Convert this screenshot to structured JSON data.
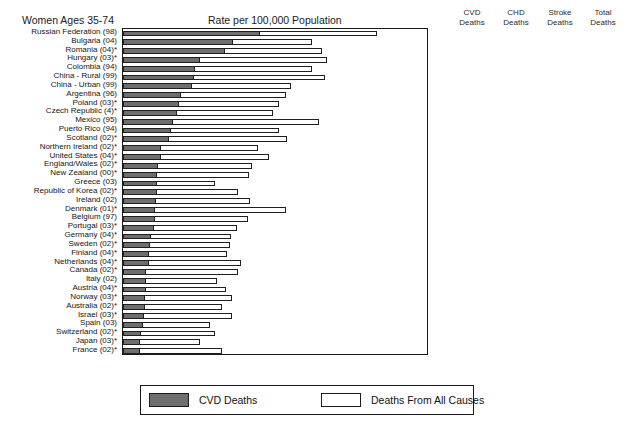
{
  "header": {
    "left_title": "Women Ages 35-74",
    "center_title": "Rate per 100,000 Population"
  },
  "columns": [
    {
      "line1": "CVD",
      "line2": "Deaths"
    },
    {
      "line1": "CHD",
      "line2": "Deaths"
    },
    {
      "line1": "Stroke",
      "line2": "Deaths"
    },
    {
      "line1": "Total",
      "line2": "Deaths"
    }
  ],
  "legend": {
    "cvd_label": "CVD Deaths",
    "all_label": "Deaths From All Causes",
    "cvd_color": "#6e6e6e",
    "all_color": "#ffffff"
  },
  "axis": {
    "ticks": [
      0,
      200,
      400,
      600,
      800,
      1000,
      1200
    ],
    "tick_labels": [
      "0",
      "200",
      "400",
      "600",
      "800",
      "1000",
      "1200"
    ],
    "min": 0,
    "max": 1200
  },
  "chart_data": {
    "type": "bar",
    "title": "Women Ages 35-74",
    "subtitle": "Rate per 100,000 Population",
    "xlabel": "Rate per 100,000 Population",
    "ylabel": "",
    "xlim": [
      0,
      1200
    ],
    "grid": false,
    "orientation": "horizontal",
    "legend_position": "bottom",
    "legend_entries": [
      "CVD Deaths",
      "Deaths From All Causes"
    ],
    "highlight_category": "United States (04)*",
    "categories": [
      "Russian Federation (98)",
      "Bulgaria (04)",
      "Romania (04)*",
      "Hungary (03)*",
      "Colombia (94)",
      "China - Rural (99)",
      "China - Urban (99)",
      "Argentina (96)",
      "Poland (03)*",
      "Czech Republic (4)*",
      "Mexico (95)",
      "Puerto Rico (94)",
      "Scotland (02)*",
      "Northern Ireland (02)*",
      "United States (04)*",
      "England/Wales (02)*",
      "New Zealand (00)*",
      "Greece (03)",
      "Republic of Korea (02)*",
      "Ireland (02)",
      "Denmark (01)*",
      "Belgium (97)",
      "Portugal (03)*",
      "Germany (04)*",
      "Sweden (02)*",
      "Finland (04)*",
      "Netherlands (04)*",
      "Canada (02)*",
      "Italy (02)",
      "Austria (04)*",
      "Norway (03)*",
      "Australia (02)*",
      "Israel (03)*",
      "Spain (03)",
      "Switzerland (02)*",
      "Japan (03)*",
      "France (02)*"
    ],
    "series": [
      {
        "name": "CVD Deaths",
        "values": [
          540,
          435,
          403,
          303,
          286,
          279,
          273,
          227,
          222,
          213,
          197,
          189,
          183,
          150,
          150,
          138,
          136,
          134,
          133,
          130,
          127,
          126,
          123,
          111,
          107,
          104,
          102,
          92,
          92,
          90,
          88,
          85,
          83,
          79,
          71,
          69,
          66
        ]
      },
      {
        "name": "Deaths From All Causes",
        "values": [
          1001,
          746,
          787,
          807,
          748,
          799,
          663,
          642,
          617,
          594,
          773,
          616,
          649,
          534,
          575,
          509,
          498,
          364,
          452,
          502,
          642,
          494,
          449,
          426,
          422,
          412,
          466,
          452,
          372,
          405,
          430,
          390,
          431,
          343,
          362,
          302,
          389
        ]
      }
    ],
    "chd_deaths": [
      230,
      100,
      134,
      133,
      110,
      41,
      71,
      39,
      68,
      82,
      73,
      78,
      98,
      79,
      73,
      68,
      71,
      46,
      24,
      66,
      51,
      44,
      35,
      45,
      51,
      48,
      34,
      48,
      29,
      42,
      38,
      43,
      31,
      26,
      27,
      16,
      16
    ],
    "stroke_deaths": [
      229,
      133,
      166,
      91,
      84,
      152,
      147,
      63,
      63,
      52,
      52,
      25,
      48,
      41,
      27,
      36,
      33,
      44,
      87,
      27,
      37,
      35,
      55,
      23,
      30,
      32,
      26,
      20,
      25,
      19,
      25,
      20,
      22,
      23,
      15,
      31,
      18
    ]
  }
}
